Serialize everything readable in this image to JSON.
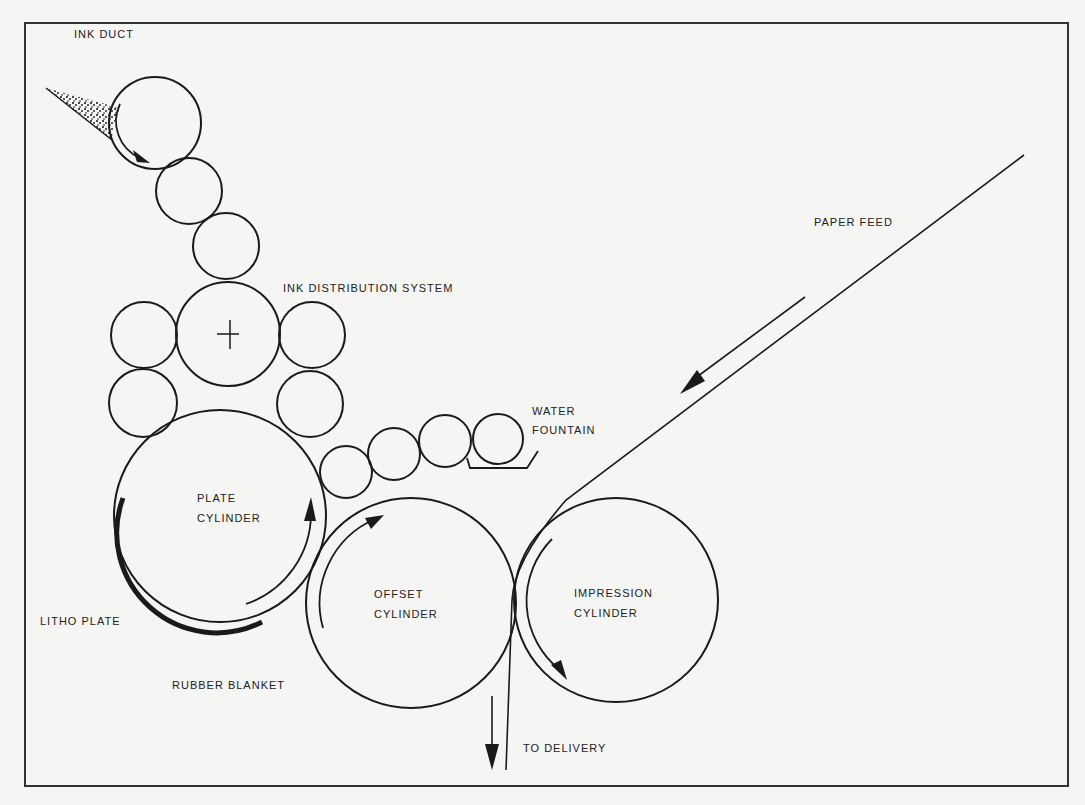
{
  "diagram": {
    "colors": {
      "background": "#f5f5f3",
      "stroke": "#1a1a1a",
      "text": "#222222"
    },
    "labels": {
      "ink_duct": "INK  DUCT",
      "ink_distribution_system": "INK  DISTRIBUTION  SYSTEM",
      "paper_feed": "PAPER  FEED",
      "water_fountain_line1": "WATER",
      "water_fountain_line2": "FOUNTAIN",
      "plate_cylinder_line1": "PLATE",
      "plate_cylinder_line2": "CYLINDER",
      "offset_cylinder_line1": "OFFSET",
      "offset_cylinder_line2": "CYLINDER",
      "impression_cylinder_line1": "IMPRESSION",
      "impression_cylinder_line2": "CYLINDER",
      "litho_plate": "LITHO  PLATE",
      "rubber_blanket": "RUBBER  BLANKET",
      "to_delivery": "TO  DELIVERY"
    },
    "components": [
      {
        "name": "ink-duct-roller",
        "cx": 155,
        "cy": 123,
        "r": 46
      },
      {
        "name": "ink-roller-2",
        "cx": 189,
        "cy": 191,
        "r": 33
      },
      {
        "name": "ink-roller-3",
        "cx": 226,
        "cy": 246,
        "r": 33
      },
      {
        "name": "ink-drum",
        "cx": 228,
        "cy": 334,
        "r": 52
      },
      {
        "name": "ink-roller-left-upper",
        "cx": 144,
        "cy": 335,
        "r": 33
      },
      {
        "name": "ink-roller-left-lower",
        "cx": 143,
        "cy": 403,
        "r": 34
      },
      {
        "name": "ink-roller-right-upper",
        "cx": 312,
        "cy": 335,
        "r": 33
      },
      {
        "name": "ink-roller-right-lower",
        "cx": 310,
        "cy": 404,
        "r": 33
      },
      {
        "name": "plate-cylinder",
        "cx": 220,
        "cy": 516,
        "r": 106
      },
      {
        "name": "water-roller-1",
        "cx": 346,
        "cy": 472,
        "r": 26
      },
      {
        "name": "water-roller-2",
        "cx": 394,
        "cy": 454,
        "r": 26
      },
      {
        "name": "water-roller-3",
        "cx": 445,
        "cy": 441,
        "r": 26
      },
      {
        "name": "water-roller-4",
        "cx": 498,
        "cy": 439,
        "r": 25
      },
      {
        "name": "offset-cylinder",
        "cx": 411,
        "cy": 603,
        "r": 105
      },
      {
        "name": "impression-cylinder",
        "cx": 616,
        "cy": 600,
        "r": 102
      }
    ]
  }
}
